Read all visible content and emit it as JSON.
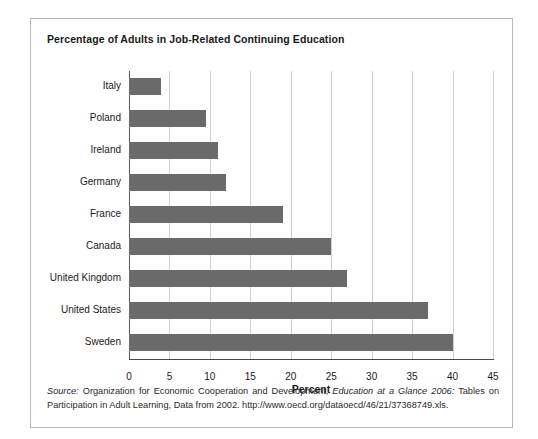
{
  "figure": {
    "title": "Percentage of Adults in Job-Related Continuing Education",
    "source_prefix": "Source:",
    "source_text_1": " Organization for Economic Cooperation and Development, ",
    "source_italic": "Education at a Glance 2006:",
    "source_text_2": " Tables on Participation in Adult Learning, Data from 2002. http://www.oecd.org/dataoecd/46/21/37368749.xls."
  },
  "chart_data": {
    "type": "bar",
    "orientation": "horizontal",
    "title": "Percentage of Adults in Job-Related Continuing Education",
    "xlabel": "Percent",
    "ylabel": "",
    "xlim": [
      0,
      45
    ],
    "xticks": [
      0,
      5,
      10,
      15,
      20,
      25,
      30,
      35,
      40,
      45
    ],
    "xtick_labels": [
      "0",
      "5",
      "10",
      "15",
      "20",
      "25",
      "30",
      "35",
      "40",
      "45"
    ],
    "grid": "vertical",
    "legend": "none",
    "bar_color": "#6a6a6a",
    "categories": [
      "Italy",
      "Poland",
      "Ireland",
      "Germany",
      "France",
      "Canada",
      "United Kingdom",
      "United States",
      "Sweden"
    ],
    "values": [
      4,
      9.5,
      11,
      12,
      19,
      25,
      27,
      37,
      40
    ]
  }
}
